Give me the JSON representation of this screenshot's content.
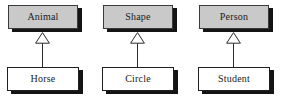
{
  "diagram": {
    "type": "uml-class-inheritance",
    "title": "",
    "background_color": "#ffffff",
    "superclass_fill": "#c9c9c9",
    "subclass_fill": "#ffffff",
    "border_color": "#2b2b2b",
    "shadow_color": "#141414",
    "relationship_label": "generalization",
    "arrow_head": "hollow-triangle",
    "groups": [
      {
        "superclass": "Animal",
        "subclass": "Horse",
        "relation": "Horse is-a Animal"
      },
      {
        "superclass": "Shape",
        "subclass": "Circle",
        "relation": "Circle is-a Shape"
      },
      {
        "superclass": "Person",
        "subclass": "Student",
        "relation": "Student is-a Person"
      }
    ]
  }
}
